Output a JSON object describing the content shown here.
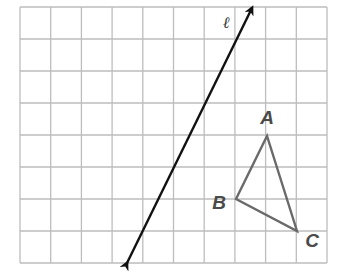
{
  "grid": {
    "left": 20,
    "top": 7,
    "cols": 10,
    "rows": 8,
    "cell_w": 30.7,
    "cell_h": 32,
    "line_color": "#bdbdbd"
  },
  "line_l": {
    "label": "ℓ",
    "start": [
      127,
      263
    ],
    "end": [
      252,
      8
    ],
    "color": "#111111",
    "label_pos": [
      226,
      28
    ]
  },
  "triangle": {
    "color": "#6a6a6a",
    "vertices": [
      {
        "name": "A",
        "point": [
          267,
          136
        ],
        "label_pos": [
          267,
          124
        ]
      },
      {
        "name": "B",
        "point": [
          236,
          199
        ],
        "label_pos": [
          219,
          209
        ]
      },
      {
        "name": "C",
        "point": [
          297,
          231
        ],
        "label_pos": [
          312,
          247
        ]
      }
    ]
  }
}
